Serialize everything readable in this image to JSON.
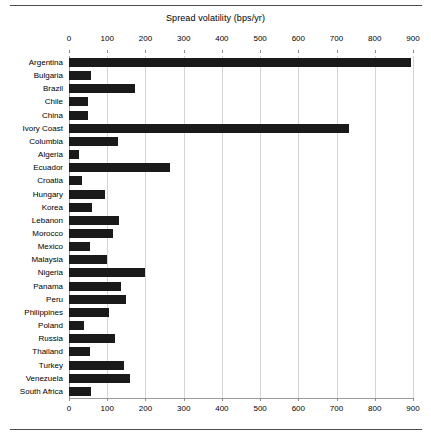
{
  "chart_data": {
    "type": "bar",
    "orientation": "horizontal",
    "title": "Spread volatility (bps/yr)",
    "xlabel": "Spread volatility (bps/yr)",
    "ylabel": "",
    "xlim": [
      0,
      900
    ],
    "xticks": [
      0,
      100,
      200,
      300,
      400,
      500,
      600,
      700,
      800,
      900
    ],
    "xtick_labels": [
      "0",
      "100",
      "200",
      "300",
      "400",
      "500",
      "600",
      "700",
      "800",
      "900"
    ],
    "grid": true,
    "grid_axis": "x",
    "legend": false,
    "bar_color": "#1a1a1a",
    "axis_positions": [
      "top",
      "bottom"
    ],
    "categories": [
      "Argentina",
      "Bulgaria",
      "Brazil",
      "Chile",
      "China",
      "Ivory Coast",
      "Columbia",
      "Algeria",
      "Ecuador",
      "Croatia",
      "Hungary",
      "Korea",
      "Lebanon",
      "Morocco",
      "Mexico",
      "Malaysia",
      "Nigeria",
      "Panama",
      "Peru",
      "Philippines",
      "Poland",
      "Russia",
      "Thailand",
      "Turkey",
      "Venezuela",
      "South Africa"
    ],
    "values": [
      895,
      57,
      172,
      50,
      50,
      733,
      127,
      25,
      265,
      35,
      95,
      60,
      130,
      115,
      55,
      100,
      200,
      135,
      150,
      105,
      40,
      120,
      55,
      145,
      160,
      58
    ]
  }
}
